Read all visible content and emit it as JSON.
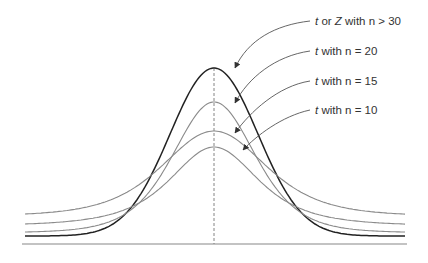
{
  "chart_data": {
    "type": "line",
    "title": "",
    "xlabel": "",
    "ylabel": "",
    "grid": false,
    "legend_position": "annotations (upper right, with arrows)",
    "center_line": "dashed vertical at mean",
    "series": [
      {
        "name": "t or Z with n > 30",
        "label_var": "t",
        "label_mid": " or ",
        "label_var2": "Z",
        "label_rest": " with n > 30",
        "df": "inf",
        "peak_height": 1.0,
        "color": "#222222"
      },
      {
        "name": "t with n = 20",
        "label_var": "t",
        "label_rest": " with n = 20",
        "df": 20,
        "peak_height": 0.81,
        "color": "#8a8a8a"
      },
      {
        "name": "t with n = 15",
        "label_var": "t",
        "label_rest": " with n = 15",
        "df": 15,
        "peak_height": 0.65,
        "color": "#8a8a8a"
      },
      {
        "name": "t with n = 10",
        "label_var": "t",
        "label_rest": " with n = 10",
        "df": 10,
        "peak_height": 0.55,
        "color": "#8a8a8a"
      }
    ]
  }
}
